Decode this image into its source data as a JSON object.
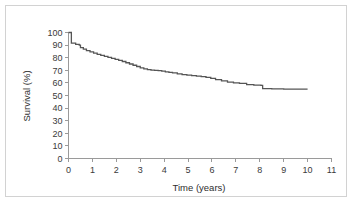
{
  "chart_data": {
    "type": "line",
    "title": "",
    "subtitle": "",
    "xlabel": "Time (years)",
    "ylabel": "Survival (%)",
    "xlim": [
      0,
      11
    ],
    "ylim": [
      0,
      100
    ],
    "grid": false,
    "legend": null,
    "legend_position": "none",
    "xticks": [
      0,
      1,
      2,
      3,
      4,
      5,
      6,
      7,
      8,
      9,
      10,
      11
    ],
    "xticklabels": [
      "0",
      "1",
      "2",
      "3",
      "4",
      "5",
      "6",
      "7",
      "8",
      "9",
      "10",
      "11"
    ],
    "yticks": [
      0,
      10,
      20,
      30,
      40,
      50,
      60,
      70,
      80,
      90,
      100
    ],
    "yticklabels": [
      "0",
      "10",
      "20",
      "30",
      "40",
      "50",
      "60",
      "70",
      "80",
      "90",
      "100"
    ],
    "step_style": "post",
    "curve_color": "#555555",
    "axis_color": "#9a9a9a",
    "text_color": "#3a3a3a",
    "series": [
      {
        "name": "Survival",
        "x": [
          0.0,
          0.08,
          0.12,
          0.3,
          0.45,
          0.5,
          0.62,
          0.75,
          0.9,
          1.05,
          1.2,
          1.35,
          1.5,
          1.65,
          1.8,
          1.95,
          2.1,
          2.25,
          2.4,
          2.55,
          2.7,
          2.85,
          3.0,
          3.15,
          3.3,
          3.45,
          3.6,
          3.75,
          3.9,
          4.05,
          4.2,
          4.35,
          4.55,
          4.75,
          4.95,
          5.15,
          5.35,
          5.55,
          5.75,
          5.95,
          6.15,
          6.4,
          6.65,
          6.9,
          7.15,
          7.45,
          7.75,
          8.05,
          8.12,
          8.5,
          9.0,
          9.5,
          10.0
        ],
        "y": [
          100.0,
          100.0,
          91.5,
          90.5,
          90.0,
          88.0,
          86.8,
          85.6,
          84.6,
          83.6,
          82.6,
          81.8,
          81.0,
          80.2,
          79.4,
          78.6,
          77.8,
          77.0,
          76.0,
          75.0,
          74.0,
          73.0,
          72.0,
          71.2,
          70.6,
          70.2,
          70.0,
          69.8,
          69.4,
          68.8,
          68.4,
          68.0,
          67.2,
          66.6,
          66.2,
          65.8,
          65.4,
          65.0,
          64.4,
          63.6,
          62.6,
          61.6,
          60.6,
          60.0,
          59.6,
          58.6,
          58.2,
          58.0,
          55.4,
          55.2,
          55.0,
          55.0,
          55.0
        ]
      }
    ],
    "annotations": []
  },
  "axes": {
    "y_title": "Survival (%)",
    "x_title": "Time (years)"
  }
}
